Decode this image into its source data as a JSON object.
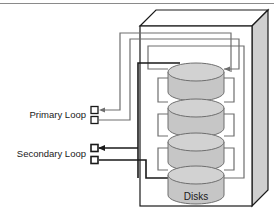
{
  "figure": {
    "type": "diagram",
    "background": "#ffffff"
  },
  "colors": {
    "outline": "#1a1a1a",
    "primary_loop": "#6e6e6e",
    "secondary_loop": "#1a1a1a",
    "disk_body": "#c6c6c6",
    "disk_top": "#d2d2d2",
    "cabinet_face": "#ffffff",
    "cabinet_side": "#cfcfcf",
    "cabinet_top": "#ffffff",
    "rule": "#8a8a8a"
  },
  "labels": {
    "primary_loop": "Primary Loop",
    "secondary_loop": "Secondary Loop",
    "disks": "Disks"
  },
  "cabinet": {
    "name": "disk-enclosure",
    "face": {
      "x": 140,
      "y": 26,
      "w": 112,
      "h": 180
    },
    "depth_x": 16,
    "depth_y": -16
  },
  "disks": [
    {
      "id": "disk-1",
      "cx": 196,
      "cy": 72,
      "rx": 28,
      "ry": 9,
      "body_h": 20
    },
    {
      "id": "disk-2",
      "cx": 196,
      "cy": 108,
      "rx": 28,
      "ry": 9,
      "body_h": 20
    },
    {
      "id": "disk-3",
      "cx": 196,
      "cy": 142,
      "rx": 28,
      "ry": 9,
      "body_h": 20
    },
    {
      "id": "disk-4",
      "cx": 196,
      "cy": 175,
      "rx": 28,
      "ry": 9,
      "body_h": 20
    }
  ],
  "terminals": [
    {
      "id": "primary-terminal-in",
      "x": 91,
      "y": 110,
      "loop": "primary",
      "arrow": true
    },
    {
      "id": "primary-terminal-out",
      "x": 91,
      "y": 120,
      "loop": "primary",
      "arrow": false
    },
    {
      "id": "secondary-terminal-in",
      "x": 91,
      "y": 148,
      "loop": "secondary",
      "arrow": true
    },
    {
      "id": "secondary-terminal-out",
      "x": 91,
      "y": 160,
      "loop": "secondary",
      "arrow": false
    }
  ],
  "loops": [
    {
      "name": "primary",
      "color": "#6e6e6e",
      "width": 1.2,
      "connects": "top disk via outer routing"
    },
    {
      "name": "secondary",
      "color": "#1a1a1a",
      "width": 1.6,
      "connects": "bottom disk via inner routing"
    }
  ]
}
